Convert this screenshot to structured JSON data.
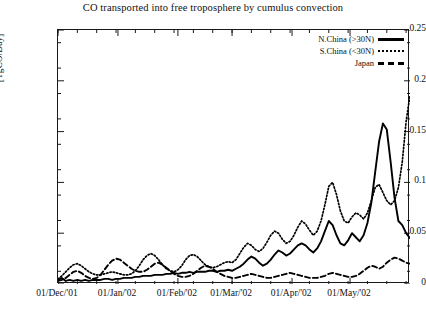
{
  "chart_data": {
    "type": "line",
    "title": "CO transported into free troposphere by cumulus convection",
    "xlabel": "",
    "ylabel": "[TgCO/Day]",
    "ylim": [
      0,
      0.25
    ],
    "yticks": [
      "0",
      "0.05",
      "0.1",
      "0.15",
      "0.2",
      "0.25"
    ],
    "ytick_values": [
      0,
      0.05,
      0.1,
      0.15,
      0.2,
      0.25
    ],
    "xticks": [
      "01/Dec/'01",
      "01/Jan/'02",
      "01/Feb/'02",
      "01/Mar/'02",
      "01/Apr/'02",
      "01/May/'02"
    ],
    "xtick_positions": [
      0,
      31,
      62,
      90,
      121,
      151
    ],
    "xlim": [
      0,
      182
    ],
    "grid": false,
    "legend_position": "top-right",
    "x": [
      0,
      2,
      4,
      6,
      8,
      10,
      12,
      14,
      16,
      18,
      20,
      22,
      24,
      26,
      28,
      30,
      32,
      34,
      36,
      38,
      40,
      42,
      44,
      46,
      48,
      50,
      52,
      54,
      56,
      58,
      60,
      62,
      64,
      66,
      68,
      70,
      72,
      74,
      76,
      78,
      80,
      82,
      84,
      86,
      88,
      90,
      92,
      94,
      96,
      98,
      100,
      102,
      104,
      106,
      108,
      110,
      112,
      114,
      116,
      118,
      120,
      122,
      124,
      126,
      128,
      130,
      132,
      134,
      136,
      138,
      140,
      142,
      144,
      146,
      148,
      150,
      152,
      154,
      156,
      158,
      160,
      162,
      164,
      166,
      168,
      170,
      172,
      174,
      176,
      178,
      180,
      182
    ],
    "series": [
      {
        "name": "N.China (>30N)",
        "style": "solid",
        "color": "#000000",
        "values": [
          0.004,
          0.006,
          0.003,
          0.004,
          0.003,
          0.004,
          0.003,
          0.004,
          0.003,
          0.004,
          0.004,
          0.004,
          0.005,
          0.005,
          0.004,
          0.005,
          0.005,
          0.006,
          0.006,
          0.006,
          0.007,
          0.007,
          0.008,
          0.008,
          0.008,
          0.009,
          0.009,
          0.009,
          0.01,
          0.01,
          0.011,
          0.01,
          0.011,
          0.011,
          0.012,
          0.011,
          0.012,
          0.012,
          0.012,
          0.013,
          0.013,
          0.012,
          0.013,
          0.013,
          0.014,
          0.013,
          0.015,
          0.017,
          0.02,
          0.024,
          0.027,
          0.025,
          0.021,
          0.018,
          0.02,
          0.024,
          0.029,
          0.033,
          0.031,
          0.028,
          0.03,
          0.034,
          0.038,
          0.04,
          0.038,
          0.034,
          0.031,
          0.035,
          0.042,
          0.052,
          0.062,
          0.058,
          0.048,
          0.04,
          0.038,
          0.043,
          0.05,
          0.046,
          0.042,
          0.048,
          0.06,
          0.08,
          0.11,
          0.14,
          0.158,
          0.152,
          0.12,
          0.085,
          0.062,
          0.058,
          0.05,
          0.045
        ]
      },
      {
        "name": "S.China (<30N)",
        "style": "dotted",
        "color": "#000000",
        "values": [
          0.005,
          0.008,
          0.012,
          0.016,
          0.019,
          0.02,
          0.018,
          0.015,
          0.012,
          0.01,
          0.009,
          0.009,
          0.01,
          0.011,
          0.012,
          0.011,
          0.01,
          0.009,
          0.009,
          0.01,
          0.013,
          0.018,
          0.024,
          0.028,
          0.03,
          0.028,
          0.024,
          0.019,
          0.015,
          0.013,
          0.012,
          0.014,
          0.018,
          0.024,
          0.028,
          0.029,
          0.027,
          0.023,
          0.019,
          0.017,
          0.016,
          0.017,
          0.019,
          0.021,
          0.022,
          0.021,
          0.024,
          0.03,
          0.036,
          0.04,
          0.038,
          0.034,
          0.032,
          0.035,
          0.041,
          0.048,
          0.052,
          0.05,
          0.044,
          0.04,
          0.042,
          0.048,
          0.056,
          0.062,
          0.059,
          0.053,
          0.048,
          0.052,
          0.062,
          0.078,
          0.096,
          0.1,
          0.088,
          0.072,
          0.062,
          0.06,
          0.066,
          0.07,
          0.068,
          0.064,
          0.07,
          0.082,
          0.095,
          0.098,
          0.09,
          0.082,
          0.078,
          0.082,
          0.095,
          0.12,
          0.16,
          0.186
        ]
      },
      {
        "name": "Japan",
        "style": "dashed",
        "color": "#000000",
        "values": [
          0.003,
          0.004,
          0.006,
          0.009,
          0.012,
          0.013,
          0.011,
          0.008,
          0.006,
          0.005,
          0.006,
          0.009,
          0.014,
          0.019,
          0.023,
          0.025,
          0.024,
          0.021,
          0.018,
          0.015,
          0.013,
          0.012,
          0.012,
          0.014,
          0.017,
          0.02,
          0.021,
          0.019,
          0.016,
          0.013,
          0.01,
          0.008,
          0.007,
          0.007,
          0.008,
          0.01,
          0.013,
          0.016,
          0.018,
          0.017,
          0.015,
          0.012,
          0.01,
          0.008,
          0.007,
          0.006,
          0.006,
          0.007,
          0.008,
          0.009,
          0.01,
          0.009,
          0.008,
          0.007,
          0.006,
          0.006,
          0.007,
          0.008,
          0.009,
          0.01,
          0.011,
          0.01,
          0.009,
          0.008,
          0.007,
          0.006,
          0.006,
          0.006,
          0.007,
          0.008,
          0.01,
          0.011,
          0.01,
          0.009,
          0.008,
          0.007,
          0.007,
          0.008,
          0.01,
          0.013,
          0.016,
          0.018,
          0.017,
          0.015,
          0.017,
          0.021,
          0.024,
          0.026,
          0.025,
          0.023,
          0.021,
          0.02
        ]
      }
    ]
  }
}
